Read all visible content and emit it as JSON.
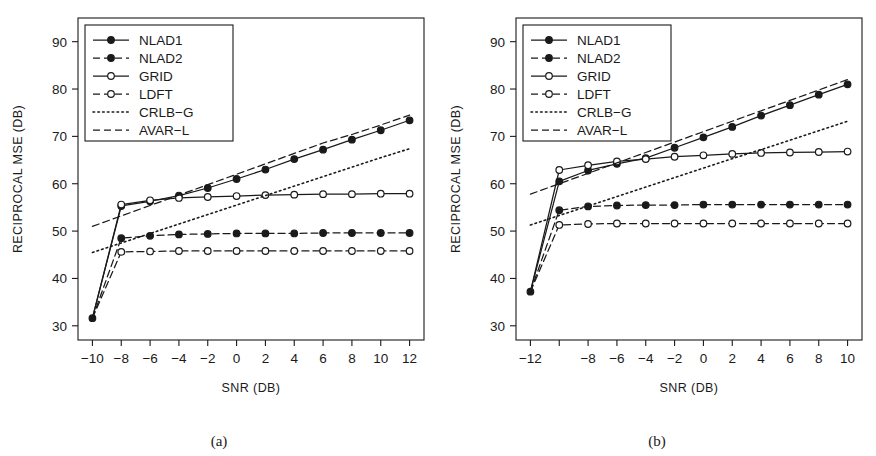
{
  "figure": {
    "background": "#ffffff",
    "ink": "#1a1a1a"
  },
  "panels": [
    {
      "id": "a",
      "caption": "(a)",
      "axes": {
        "xlabel": "SNR (DB)",
        "ylabel": "RECIPROCAL MSE (DB)",
        "xlim": [
          -11,
          13
        ],
        "ylim": [
          27,
          95
        ],
        "xticks": [
          -10,
          -8,
          -6,
          -4,
          -2,
          0,
          2,
          4,
          6,
          8,
          10,
          12
        ],
        "xticklabels": [
          "-10",
          "-8",
          "-6",
          "-4",
          "-2",
          "0",
          "2",
          "4",
          "6",
          "8",
          "10",
          "12"
        ],
        "yticks": [
          30,
          40,
          50,
          60,
          70,
          80,
          90
        ],
        "yticklabels": [
          "30",
          "40",
          "50",
          "60",
          "70",
          "80",
          "90"
        ],
        "grid": false
      },
      "legend": {
        "position": "top-left",
        "entries": [
          "NLAD1",
          "NLAD2",
          "GRID",
          "LDFT",
          "CRLB-G",
          "AVAR-L"
        ]
      },
      "chart_data": {
        "type": "line",
        "title": "",
        "xlabel": "SNR (DB)",
        "ylabel": "RECIPROCAL MSE (DB)",
        "xlim": [
          -11,
          13
        ],
        "ylim": [
          27,
          95
        ],
        "grid": false,
        "legend_position": "top-left",
        "x": [
          -10,
          -8,
          -6,
          -4,
          -2,
          0,
          2,
          4,
          6,
          8,
          10,
          12
        ],
        "series": [
          {
            "name": "NLAD1",
            "style": "solid",
            "marker": "filled-circle",
            "values": [
              31.6,
              55.3,
              56.3,
              57.5,
              59.1,
              61.0,
              63.0,
              65.2,
              67.2,
              69.3,
              71.3,
              73.4
            ]
          },
          {
            "name": "NLAD2",
            "style": "dashed",
            "marker": "filled-circle",
            "values": [
              31.6,
              48.5,
              49.0,
              49.3,
              49.4,
              49.5,
              49.5,
              49.5,
              49.6,
              49.6,
              49.6,
              49.6
            ]
          },
          {
            "name": "GRID",
            "style": "solid",
            "marker": "open-circle",
            "values": [
              31.6,
              55.6,
              56.5,
              57.0,
              57.2,
              57.4,
              57.6,
              57.7,
              57.8,
              57.8,
              57.9,
              57.9
            ]
          },
          {
            "name": "LDFT",
            "style": "dashed",
            "marker": "open-circle",
            "values": [
              31.6,
              45.6,
              45.7,
              45.8,
              45.8,
              45.8,
              45.8,
              45.8,
              45.8,
              45.8,
              45.8,
              45.8
            ]
          },
          {
            "name": "CRLB-G",
            "style": "dotted",
            "marker": "none",
            "values": [
              45.5,
              47.5,
              49.5,
              51.5,
              53.5,
              55.5,
              57.5,
              59.5,
              61.5,
              63.5,
              65.5,
              67.4
            ]
          },
          {
            "name": "AVAR-L",
            "style": "dashed",
            "marker": "none",
            "values": [
              51.0,
              53.2,
              55.4,
              57.6,
              59.8,
              62.0,
              64.2,
              66.4,
              68.6,
              70.4,
              72.4,
              74.5
            ]
          }
        ]
      }
    },
    {
      "id": "b",
      "caption": "(b)",
      "axes": {
        "xlabel": "SNR (DB)",
        "ylabel": "RECIPROCAL MSE (DB)",
        "xlim": [
          -13,
          11
        ],
        "ylim": [
          27,
          95
        ],
        "xticks": [
          -12,
          -10,
          -8,
          -6,
          -4,
          -2,
          0,
          2,
          4,
          6,
          8,
          10
        ],
        "xticklabels": [
          "-12",
          "",
          "-8",
          "-6",
          "-4",
          "-2",
          "0",
          "2",
          "4",
          "6",
          "8",
          "10"
        ],
        "yticks": [
          30,
          40,
          50,
          60,
          70,
          80,
          90
        ],
        "yticklabels": [
          "30",
          "40",
          "50",
          "60",
          "70",
          "80",
          "90"
        ],
        "grid": false
      },
      "legend": {
        "position": "top-left",
        "entries": [
          "NLAD1",
          "NLAD2",
          "GRID",
          "LDFT",
          "CRLB-G",
          "AVAR-L"
        ]
      },
      "chart_data": {
        "type": "line",
        "title": "",
        "xlabel": "SNR (DB)",
        "ylabel": "RECIPROCAL MSE (DB)",
        "xlim": [
          -13,
          11
        ],
        "ylim": [
          27,
          95
        ],
        "grid": false,
        "legend_position": "top-left",
        "x": [
          -12,
          -10,
          -8,
          -6,
          -4,
          -2,
          0,
          2,
          4,
          6,
          8,
          10
        ],
        "series": [
          {
            "name": "NLAD1",
            "style": "solid",
            "marker": "filled-circle",
            "values": [
              37.2,
              60.5,
              62.8,
              64.2,
              65.4,
              67.6,
              69.8,
              72.0,
              74.4,
              76.6,
              78.8,
              81.0
            ]
          },
          {
            "name": "NLAD2",
            "style": "dashed",
            "marker": "filled-circle",
            "values": [
              37.2,
              54.4,
              55.2,
              55.4,
              55.5,
              55.5,
              55.6,
              55.6,
              55.6,
              55.6,
              55.6,
              55.6
            ]
          },
          {
            "name": "GRID",
            "style": "solid",
            "marker": "open-circle",
            "values": [
              37.2,
              62.9,
              63.9,
              64.7,
              65.2,
              65.7,
              66.0,
              66.3,
              66.5,
              66.6,
              66.7,
              66.8
            ]
          },
          {
            "name": "LDFT",
            "style": "dashed",
            "marker": "open-circle",
            "values": [
              37.2,
              51.3,
              51.5,
              51.6,
              51.6,
              51.6,
              51.6,
              51.6,
              51.6,
              51.6,
              51.6,
              51.6
            ]
          },
          {
            "name": "CRLB-G",
            "style": "dotted",
            "marker": "none",
            "values": [
              51.3,
              53.3,
              55.3,
              57.3,
              59.3,
              61.3,
              63.3,
              65.3,
              67.2,
              69.2,
              71.2,
              73.2
            ]
          },
          {
            "name": "AVAR-L",
            "style": "dashed",
            "marker": "none",
            "values": [
              57.8,
              60.0,
              62.2,
              64.4,
              66.6,
              68.8,
              71.0,
              73.2,
              75.4,
              77.6,
              79.8,
              82.0
            ]
          }
        ]
      }
    }
  ]
}
